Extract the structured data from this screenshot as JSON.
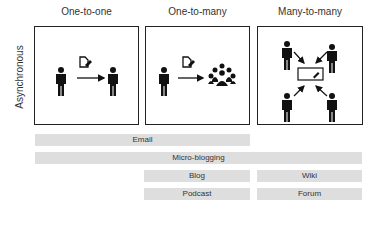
{
  "columns": [
    {
      "title": "One-to-one"
    },
    {
      "title": "One-to-many"
    },
    {
      "title": "Many-to-many"
    }
  ],
  "row_label": "Asynchronous",
  "icons": [
    "person-icon",
    "document-edit-icon",
    "arrow-right-icon",
    "group-icon",
    "whiteboard-icon",
    "pencil-icon"
  ],
  "bars": [
    {
      "label": "Email",
      "span": "one-to-one..one-to-many"
    },
    {
      "label": "Micro-blogging",
      "span": "one-to-one..many-to-many"
    },
    {
      "label": "Blog",
      "span": "one-to-many"
    },
    {
      "label": "Wiki",
      "span": "many-to-many"
    },
    {
      "label": "Podcast",
      "span": "one-to-many"
    },
    {
      "label": "Forum",
      "span": "many-to-many"
    }
  ],
  "colors": {
    "bar": "#dedede",
    "ink": "#111111"
  }
}
